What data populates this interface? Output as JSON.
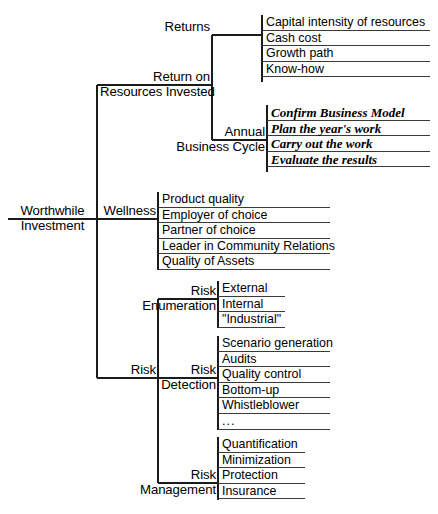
{
  "diagram": {
    "root": {
      "line1": "Worthwhile",
      "line2": "Investment"
    },
    "branches": [
      {
        "id": "return-on-resources-invested",
        "line1": "Return on",
        "line2": "Resources Invested",
        "children": [
          {
            "id": "returns",
            "line1": "Returns",
            "line2": "",
            "leaves": [
              "Capital intensity of resources",
              "Cash cost",
              "Growth path",
              "Know-how"
            ]
          },
          {
            "id": "annual-business-cycle",
            "line1": "Annual",
            "line2": "Business Cycle",
            "style": "italic",
            "leaves": [
              "Confirm Business Model",
              "Plan the year's work",
              "Carry out the work",
              "Evaluate the results"
            ]
          }
        ]
      },
      {
        "id": "wellness",
        "line1": "Wellness",
        "line2": "",
        "leaves": [
          "Product quality",
          "Employer of choice",
          "Partner of choice",
          "Leader in Community Relations",
          "Quality of Assets"
        ]
      },
      {
        "id": "risk",
        "line1": "Risk",
        "line2": "",
        "children": [
          {
            "id": "risk-enumeration",
            "line1": "Risk",
            "line2": "Enumeration",
            "leaves": [
              "External",
              "Internal",
              "\"Industrial\""
            ]
          },
          {
            "id": "risk-detection",
            "line1": "Risk",
            "line2": "Detection",
            "leaves": [
              "Scenario generation",
              "Audits",
              "Quality control",
              "Bottom-up",
              "Whistleblower",
              "..."
            ]
          },
          {
            "id": "risk-management",
            "line1": "Risk",
            "line2": "Management",
            "leaves": [
              "Quantification",
              "Minimization",
              "Protection",
              "Insurance"
            ]
          }
        ]
      }
    ],
    "colors": {
      "ink": "#000000",
      "rule": "#3a3a3a",
      "background": "#ffffff"
    }
  }
}
